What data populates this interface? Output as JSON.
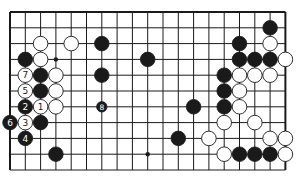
{
  "board": {
    "size": 19,
    "visible_columns": 19,
    "visible_rows": 11,
    "origin_x": 10,
    "origin_y": 12,
    "spacing_x": 15.3,
    "spacing_y": 15.8,
    "edges": {
      "top": true,
      "left": true,
      "right": true,
      "bottom": false
    },
    "colors": {
      "line": "#1a1a1a",
      "black": "#1a1a1a",
      "white": "#ffffff",
      "background": "#ffffff"
    }
  },
  "hoshi": [
    {
      "col": 3,
      "row": 3
    },
    {
      "col": 9,
      "row": 3
    },
    {
      "col": 15,
      "row": 3
    },
    {
      "col": 3,
      "row": 9
    },
    {
      "col": 9,
      "row": 9
    },
    {
      "col": 15,
      "row": 9
    }
  ],
  "stones": [
    {
      "color": "white",
      "col": 2,
      "row": 2
    },
    {
      "color": "white",
      "col": 4,
      "row": 2
    },
    {
      "color": "black",
      "col": 6,
      "row": 2
    },
    {
      "color": "black",
      "col": 1,
      "row": 3
    },
    {
      "color": "white",
      "col": 2,
      "row": 3
    },
    {
      "color": "black",
      "col": 9,
      "row": 3
    },
    {
      "color": "white",
      "col": 1,
      "row": 4,
      "label": "7"
    },
    {
      "color": "black",
      "col": 2,
      "row": 4
    },
    {
      "color": "white",
      "col": 3,
      "row": 4
    },
    {
      "color": "black",
      "col": 6,
      "row": 4
    },
    {
      "color": "white",
      "col": 1,
      "row": 5,
      "label": "5"
    },
    {
      "color": "black",
      "col": 2,
      "row": 5
    },
    {
      "color": "white",
      "col": 3,
      "row": 5
    },
    {
      "color": "black",
      "col": 1,
      "row": 6,
      "label": "2"
    },
    {
      "color": "white",
      "col": 2,
      "row": 6,
      "label": "1"
    },
    {
      "color": "white",
      "col": 3,
      "row": 6
    },
    {
      "color": "black",
      "col": 6,
      "row": 6,
      "label": "8",
      "small": true
    },
    {
      "color": "black",
      "col": 0,
      "row": 7,
      "label": "6"
    },
    {
      "color": "white",
      "col": 1,
      "row": 7,
      "label": "3"
    },
    {
      "color": "black",
      "col": 2,
      "row": 7
    },
    {
      "color": "black",
      "col": 1,
      "row": 8,
      "label": "4"
    },
    {
      "color": "black",
      "col": 3,
      "row": 9
    },
    {
      "color": "black",
      "col": 17,
      "row": 1
    },
    {
      "color": "black",
      "col": 15,
      "row": 2
    },
    {
      "color": "white",
      "col": 17,
      "row": 2
    },
    {
      "color": "black",
      "col": 15,
      "row": 3
    },
    {
      "color": "black",
      "col": 16,
      "row": 3
    },
    {
      "color": "black",
      "col": 17,
      "row": 3
    },
    {
      "color": "white",
      "col": 18,
      "row": 3
    },
    {
      "color": "black",
      "col": 14,
      "row": 4
    },
    {
      "color": "white",
      "col": 15,
      "row": 4
    },
    {
      "color": "white",
      "col": 16,
      "row": 4
    },
    {
      "color": "white",
      "col": 17,
      "row": 4
    },
    {
      "color": "black",
      "col": 14,
      "row": 5
    },
    {
      "color": "white",
      "col": 15,
      "row": 5
    },
    {
      "color": "black",
      "col": 12,
      "row": 6
    },
    {
      "color": "black",
      "col": 14,
      "row": 6
    },
    {
      "color": "white",
      "col": 15,
      "row": 6
    },
    {
      "color": "white",
      "col": 14,
      "row": 7
    },
    {
      "color": "white",
      "col": 16,
      "row": 7
    },
    {
      "color": "black",
      "col": 11,
      "row": 8
    },
    {
      "color": "white",
      "col": 13,
      "row": 8
    },
    {
      "color": "white",
      "col": 17,
      "row": 8
    },
    {
      "color": "white",
      "col": 18,
      "row": 8
    },
    {
      "color": "white",
      "col": 14,
      "row": 9
    },
    {
      "color": "black",
      "col": 15,
      "row": 9
    },
    {
      "color": "black",
      "col": 16,
      "row": 9
    },
    {
      "color": "black",
      "col": 17,
      "row": 9
    },
    {
      "color": "white",
      "col": 18,
      "row": 9
    }
  ]
}
